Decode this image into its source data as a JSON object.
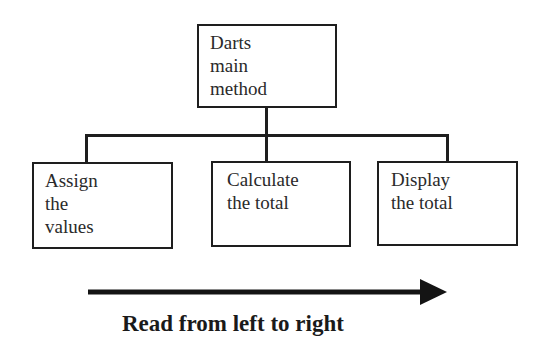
{
  "diagram": {
    "root": {
      "label": "Darts\nmain\nmethod"
    },
    "children": [
      {
        "label": "Assign\nthe\nvalues"
      },
      {
        "label": "Calculate\nthe total"
      },
      {
        "label": "Display\nthe total"
      }
    ],
    "arrow": {
      "direction": "left-to-right",
      "caption": "Read from left to right"
    }
  },
  "colors": {
    "stroke": "#1e1e1e",
    "background": "#ffffff",
    "text": "#2a2a2a"
  }
}
